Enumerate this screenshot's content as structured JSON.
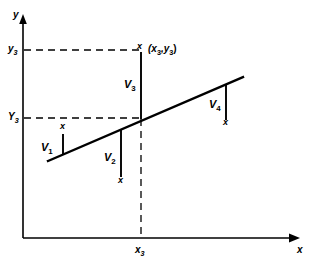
{
  "figure": {
    "type": "scatter-with-regression-line"
  },
  "axes": {
    "y_axis_label": "y",
    "x_axis_label": "x",
    "origin": {
      "x": 23,
      "y": 238
    },
    "y_axis_top": {
      "x": 23,
      "y": 18
    },
    "x_axis_right": {
      "x": 300,
      "y": 238
    }
  },
  "ticks": {
    "y_observed": {
      "label": "y",
      "sub": "3",
      "y": 50
    },
    "y_fitted": {
      "label": "Y",
      "sub": "3",
      "y": 118
    },
    "x_value": {
      "label": "x",
      "sub": "3",
      "x": 141
    }
  },
  "point_label": {
    "text": "(x",
    "sub1": "3",
    "mid": ",y",
    "sub2": "3",
    "close": ")",
    "full": "(x3,y3)"
  },
  "regression_line": {
    "x1": 48,
    "y1": 161,
    "x2": 243,
    "y2": 77
  },
  "residuals": [
    {
      "name": "V",
      "sub": "1",
      "label_x": 43,
      "label_y": 148,
      "line_x": 63,
      "line_top": 134,
      "line_bottom": 156,
      "marker_x": 60,
      "marker_y": 126,
      "marker": "x",
      "direction": "up"
    },
    {
      "name": "V",
      "sub": "2",
      "label_x": 106,
      "label_y": 158,
      "line_x": 121,
      "line_top": 130,
      "line_bottom": 177,
      "marker_x": 118,
      "marker_y": 180,
      "marker": "x",
      "direction": "down"
    },
    {
      "name": "V",
      "sub": "3",
      "label_x": 127,
      "label_y": 84,
      "line_x": 141,
      "line_top": 52,
      "line_bottom": 119,
      "marker_x": 137,
      "marker_y": 45,
      "marker": "x",
      "direction": "up"
    },
    {
      "name": "V",
      "sub": "4",
      "label_x": 211,
      "label_y": 104,
      "line_x": 226,
      "line_top": 84,
      "line_bottom": 120,
      "marker_x": 223,
      "marker_y": 122,
      "marker": "x",
      "direction": "down"
    }
  ],
  "dashed_lines": {
    "y_observed_horizontal": {
      "x1": 23,
      "y1": 50,
      "x2": 141,
      "y2": 50
    },
    "y_fitted_horizontal": {
      "x1": 23,
      "y1": 118,
      "x2": 141,
      "y2": 118
    },
    "x_vertical": {
      "x1": 141,
      "y1": 118,
      "x2": 141,
      "y2": 238
    }
  },
  "colors": {
    "ink": "#000000",
    "background": "#ffffff"
  }
}
